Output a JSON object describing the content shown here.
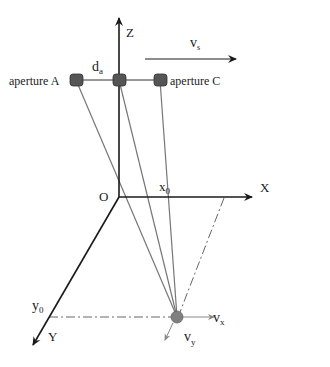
{
  "diagram": {
    "axes": {
      "z_label": "Z",
      "x_label": "X",
      "y_label": "Y",
      "origin_label": "O"
    },
    "apertures": [
      {
        "label": "aperture A"
      },
      {
        "label": ""
      },
      {
        "label": "aperture C"
      }
    ],
    "spacing_label": "d",
    "spacing_sub": "a",
    "velocity_label": "v",
    "velocity_sub": "s",
    "x0_label": "x",
    "x0_sub": "0",
    "y0_label": "y",
    "y0_sub": "0",
    "vx_label": "v",
    "vx_sub": "x",
    "vy_label": "v",
    "vy_sub": "y",
    "colors": {
      "axis": "#1a1a1a",
      "ray": "#777777",
      "aperture_fill": "#555555",
      "target_fill": "#808080",
      "dashdot": "#666666"
    }
  }
}
